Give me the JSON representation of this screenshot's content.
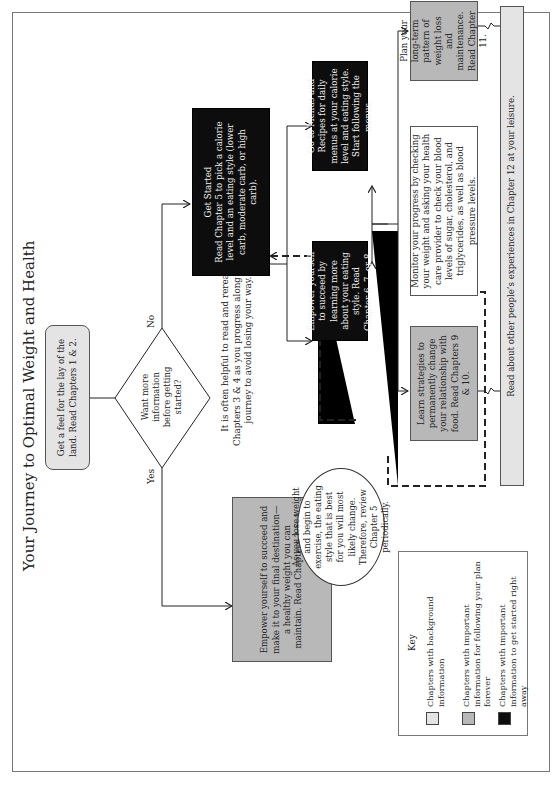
{
  "title": "Your Journey to Optimal Weight and Health",
  "colors": {
    "background_chapters": "#e4e4e4",
    "forever_chapters": "#b8b8b8",
    "get_started_chapters": "#0d0d0d"
  },
  "nodes": {
    "lay_of_land": "Get a feel for the lay of the land. Read Chapters 1 & 2.",
    "decision": "Want more information before getting started?",
    "yes_label": "Yes",
    "no_label": "No",
    "empower_final": "Empower yourself to succeed and make it to your final destination—a healthy weight you can maintain. Read Chapters 3 & 4.",
    "reread_note": "It is often helpful to read and reread Chapters 3 & 4 as you progress along your journey to avoid losing your way.",
    "get_started": "Get Started Read Chapter 5 to pick a calorie level and an eating style (lower carb, moderate carb, or high carb).",
    "get_started_title": "Get Started",
    "get_started_body": "Read Chapter 5 to pick a calorie level and an eating style (lower carb, moderate carb, or high carb).",
    "menus": "Go to Menus and Recipes for daily menus at your calorie level and eating style. Start following the menus.",
    "eating_style": "Empower yourself to succeed by learning more about your eating style. Read Chapter 6, 7, or 8.",
    "oval_note": "As you lose weight and begin to exercise, the eating style that is best for you will most likely change. Therefore, review Chapter 5 periodically.",
    "monitor": "Monitor your progress by checking your weight and asking your health care provider to check your blood levels of sugar, cholesterol, and triglycerides, as well as blood pressure levels.",
    "long_term": "Plan your long-term pattern of weight loss and maintenance. Read Chapter 11.",
    "strategies": "Learn strategies to permanently change your relationship with food. Read Chapters 9 & 10.",
    "experiences": "Read about other people’s experiences in Chapter 12 at your leisure."
  },
  "key": {
    "title": "Key",
    "items": [
      {
        "label": "Chapters with background information",
        "color": "#e4e4e4"
      },
      {
        "label": "Chapters with important information for following your plan forever",
        "color": "#b8b8b8"
      },
      {
        "label": "Chapters with important information to get started right away",
        "color": "#0d0d0d"
      }
    ]
  }
}
